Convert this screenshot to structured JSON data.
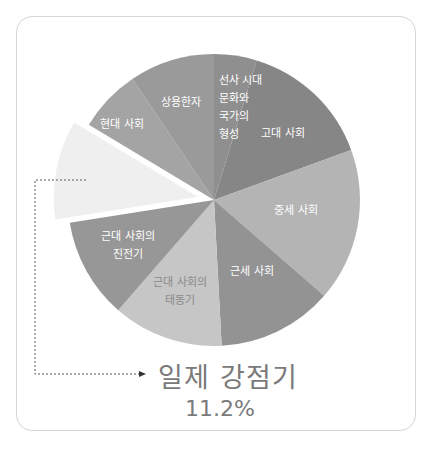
{
  "chart_data": {
    "type": "pie",
    "title": "",
    "start_angle_deg": 0,
    "direction": "clockwise",
    "slices": [
      {
        "label": "선사 시대 문화와 국가의 형성",
        "lines": [
          "선사 시대",
          "문화와",
          "국가의",
          "형성"
        ],
        "degrees": 17,
        "color": "#8f8f8f",
        "text_color": "#ffffff"
      },
      {
        "label": "고대 사회",
        "lines": [
          "고대 사회"
        ],
        "degrees": 53,
        "color": "#868686",
        "text_color": "#ffffff"
      },
      {
        "label": "중세 사회",
        "lines": [
          "중세 사회"
        ],
        "degrees": 61,
        "color": "#b4b4b4",
        "text_color": "#ffffff"
      },
      {
        "label": "근세 사회",
        "lines": [
          "근세 사회"
        ],
        "degrees": 46,
        "color": "#939393",
        "text_color": "#ffffff"
      },
      {
        "label": "근대 사회의 태동기",
        "lines": [
          "근대 사회의",
          "태동기"
        ],
        "degrees": 44,
        "color": "#c6c6c6",
        "text_color": "#8a8a8a"
      },
      {
        "label": "근대 사회의 진전기",
        "lines": [
          "근대 사회의",
          "진전기"
        ],
        "degrees": 40,
        "color": "#979797",
        "text_color": "#ffffff"
      },
      {
        "label": "일제 강점기",
        "lines": [],
        "degrees": 40,
        "percent": 11.2,
        "color": "#efefef",
        "text_color": "#7a7a7a",
        "exploded": true
      },
      {
        "label": "현대 사회",
        "lines": [
          "현대 사회"
        ],
        "degrees": 25,
        "color": "#a4a4a4",
        "text_color": "#ffffff"
      },
      {
        "label": "상용한자",
        "lines": [
          "상용한자"
        ],
        "degrees": 34,
        "color": "#9a9a9a",
        "text_color": "#ffffff"
      }
    ],
    "annotation": {
      "label": "일제 강점기",
      "value": "11.2%"
    },
    "legend": "none"
  },
  "callout": {
    "title": "일제 강점기",
    "value": "11.2%"
  }
}
